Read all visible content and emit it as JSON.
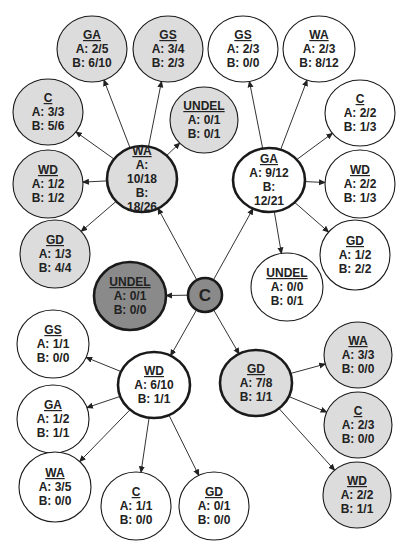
{
  "diagram": {
    "colors": {
      "gray_fill": "#dcdcdc",
      "dark_fill": "#8a8a8a",
      "white_fill": "#ffffff",
      "stroke": "#1a1a1a",
      "edge": "#333333"
    },
    "nodes": [
      {
        "id": "root",
        "title": "C",
        "lines": [],
        "style": "dark",
        "bold": true
      },
      {
        "id": "root-undel",
        "title": "UNDEL",
        "lines": [
          "A: 0/1",
          "B: 0/0"
        ],
        "style": "dark",
        "bold": true
      },
      {
        "id": "wa",
        "title": "WA",
        "lines": [
          "A:",
          "10/18",
          "B:",
          "18/26"
        ],
        "style": "gray",
        "bold": true
      },
      {
        "id": "wa-ga",
        "title": "GA",
        "lines": [
          "A: 2/5",
          "B: 6/10"
        ],
        "style": "gray",
        "bold": false
      },
      {
        "id": "wa-gs",
        "title": "GS",
        "lines": [
          "A: 3/4",
          "B: 2/3"
        ],
        "style": "gray",
        "bold": false
      },
      {
        "id": "wa-c",
        "title": "C",
        "lines": [
          "A: 3/3",
          "B: 5/6"
        ],
        "style": "gray",
        "bold": false
      },
      {
        "id": "wa-undel",
        "title": "UNDEL",
        "lines": [
          "A: 0/1",
          "B: 0/1"
        ],
        "style": "gray",
        "bold": false
      },
      {
        "id": "wa-wd",
        "title": "WD",
        "lines": [
          "A: 1/2",
          "B: 1/2"
        ],
        "style": "gray",
        "bold": false
      },
      {
        "id": "wa-gd",
        "title": "GD",
        "lines": [
          "A: 1/3",
          "B: 4/4"
        ],
        "style": "gray",
        "bold": false
      },
      {
        "id": "ga",
        "title": "GA",
        "lines": [
          "A: 9/12",
          "B:",
          "12/21"
        ],
        "style": "white",
        "bold": true
      },
      {
        "id": "ga-gs",
        "title": "GS",
        "lines": [
          "A: 2/3",
          "B: 0/0"
        ],
        "style": "white",
        "bold": false
      },
      {
        "id": "ga-wa",
        "title": "WA",
        "lines": [
          "A: 2/3",
          "B: 8/12"
        ],
        "style": "white",
        "bold": false
      },
      {
        "id": "ga-c",
        "title": "C",
        "lines": [
          "A: 2/2",
          "B: 1/3"
        ],
        "style": "white",
        "bold": false
      },
      {
        "id": "ga-wd",
        "title": "WD",
        "lines": [
          "A: 2/2",
          "B: 1/3"
        ],
        "style": "white",
        "bold": false
      },
      {
        "id": "ga-gd",
        "title": "GD",
        "lines": [
          "A: 1/2",
          "B: 2/2"
        ],
        "style": "white",
        "bold": false
      },
      {
        "id": "ga-undel",
        "title": "UNDEL",
        "lines": [
          "A: 0/0",
          "B: 0/1"
        ],
        "style": "white",
        "bold": false
      },
      {
        "id": "wd",
        "title": "WD",
        "lines": [
          "A: 6/10",
          "B: 1/1"
        ],
        "style": "white",
        "bold": true
      },
      {
        "id": "wd-gs",
        "title": "GS",
        "lines": [
          "A: 1/1",
          "B: 0/0"
        ],
        "style": "white",
        "bold": false
      },
      {
        "id": "wd-ga",
        "title": "GA",
        "lines": [
          "A: 1/2",
          "B: 1/1"
        ],
        "style": "white",
        "bold": false
      },
      {
        "id": "wd-wa",
        "title": "WA",
        "lines": [
          "A: 3/5",
          "B: 0/0"
        ],
        "style": "white",
        "bold": false
      },
      {
        "id": "wd-c",
        "title": "C",
        "lines": [
          "A: 1/1",
          "B: 0/0"
        ],
        "style": "white",
        "bold": false
      },
      {
        "id": "wd-gd",
        "title": "GD",
        "lines": [
          "A: 0/1",
          "B: 0/0"
        ],
        "style": "white",
        "bold": false
      },
      {
        "id": "gd",
        "title": "GD",
        "lines": [
          "A: 7/8",
          "B: 1/1"
        ],
        "style": "gray",
        "bold": true
      },
      {
        "id": "gd-wa",
        "title": "WA",
        "lines": [
          "A: 3/3",
          "B: 0/0"
        ],
        "style": "gray",
        "bold": false
      },
      {
        "id": "gd-c",
        "title": "C",
        "lines": [
          "A: 2/3",
          "B: 0/0"
        ],
        "style": "gray",
        "bold": false
      },
      {
        "id": "gd-wd",
        "title": "WD",
        "lines": [
          "A: 2/2",
          "B: 1/1"
        ],
        "style": "gray",
        "bold": false
      }
    ],
    "edges": [
      [
        "root",
        "root-undel"
      ],
      [
        "root",
        "wa"
      ],
      [
        "root",
        "ga"
      ],
      [
        "root",
        "wd"
      ],
      [
        "root",
        "gd"
      ],
      [
        "wa",
        "wa-ga"
      ],
      [
        "wa",
        "wa-gs"
      ],
      [
        "wa",
        "wa-c"
      ],
      [
        "wa",
        "wa-undel"
      ],
      [
        "wa",
        "wa-wd"
      ],
      [
        "wa",
        "wa-gd"
      ],
      [
        "ga",
        "ga-gs"
      ],
      [
        "ga",
        "ga-wa"
      ],
      [
        "ga",
        "ga-c"
      ],
      [
        "ga",
        "ga-wd"
      ],
      [
        "ga",
        "ga-gd"
      ],
      [
        "ga",
        "ga-undel"
      ],
      [
        "wd",
        "wd-gs"
      ],
      [
        "wd",
        "wd-ga"
      ],
      [
        "wd",
        "wd-wa"
      ],
      [
        "wd",
        "wd-c"
      ],
      [
        "wd",
        "wd-gd"
      ],
      [
        "gd",
        "gd-wa"
      ],
      [
        "gd",
        "gd-c"
      ],
      [
        "gd",
        "gd-wd"
      ]
    ]
  }
}
